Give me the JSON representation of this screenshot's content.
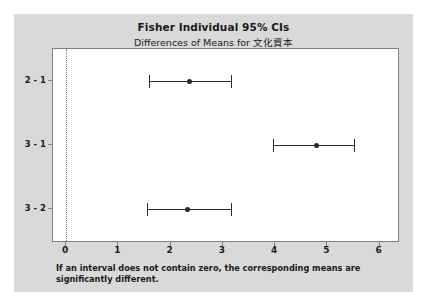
{
  "chart_data": {
    "type": "scatter",
    "title": "Fisher Individual 95% CIs",
    "subtitle": "Differences of Means for 文化資本",
    "xlabel": "",
    "ylabel": "",
    "xlim": [
      -0.25,
      6.35
    ],
    "xticks": [
      0,
      1,
      2,
      3,
      4,
      5,
      6
    ],
    "xticklabels": [
      "0",
      "1",
      "2",
      "3",
      "4",
      "5",
      "6"
    ],
    "categories": [
      "2 - 1",
      "3 - 1",
      "3 - 2"
    ],
    "grid": false,
    "legend": null,
    "reference_line": {
      "value": 0,
      "style": "dotted",
      "color": "#7a7a7a"
    },
    "series": [
      {
        "name": "Fisher individual 95% confidence intervals",
        "marker": "filled-circle",
        "color": "#2b2b2b",
        "points": [
          {
            "label": "2 - 1",
            "center": 2.37,
            "lower": 1.58,
            "upper": 3.16
          },
          {
            "label": "3 - 1",
            "center": 4.79,
            "lower": 3.96,
            "upper": 5.5
          },
          {
            "label": "3 - 2",
            "center": 2.33,
            "lower": 1.54,
            "upper": 3.15
          }
        ]
      }
    ],
    "footnote": "If an interval does not contain zero, the corresponding means are significantly different."
  },
  "figure": {
    "title": "Fisher Individual 95% CIs",
    "subtitle": "Differences of Means for 文化資本",
    "footnote": "If an interval does not contain zero, the corresponding means are significantly different."
  },
  "colors": {
    "background": "#d9d9d9",
    "panel": "#ffffff",
    "axis": "#808080",
    "marker": "#2b2b2b",
    "reference": "#7a7a7a",
    "text": "#1a1a1a"
  }
}
